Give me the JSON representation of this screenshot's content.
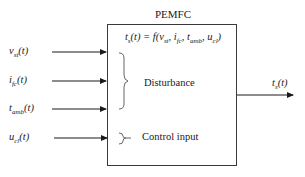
{
  "block": {
    "title": "PEMFC",
    "formula": {
      "lhs": "t",
      "lhs_sub": "s",
      "lhs_arg": "(t) = ",
      "fn": "f(",
      "args": [
        {
          "base": "v",
          "sub": "st"
        },
        {
          "base": "i",
          "sub": "fc"
        },
        {
          "base": "t",
          "sub": "amb"
        },
        {
          "base": "u",
          "sub": "cl"
        }
      ],
      "close": ")"
    }
  },
  "inputs": [
    {
      "base": "v",
      "sub": "st",
      "arg": "(t)",
      "y": 52
    },
    {
      "base": "i",
      "sub": "fc",
      "arg": "(t)",
      "y": 81
    },
    {
      "base": "t",
      "sub": "amb",
      "arg": "(t)",
      "y": 109
    },
    {
      "base": "u",
      "sub": "cl",
      "arg": "(t)",
      "y": 138
    }
  ],
  "groups": {
    "disturbance": "Disturbance",
    "control": "Control input"
  },
  "output": {
    "base": "t",
    "sub": "s",
    "arg": "(t)",
    "y": 95
  }
}
